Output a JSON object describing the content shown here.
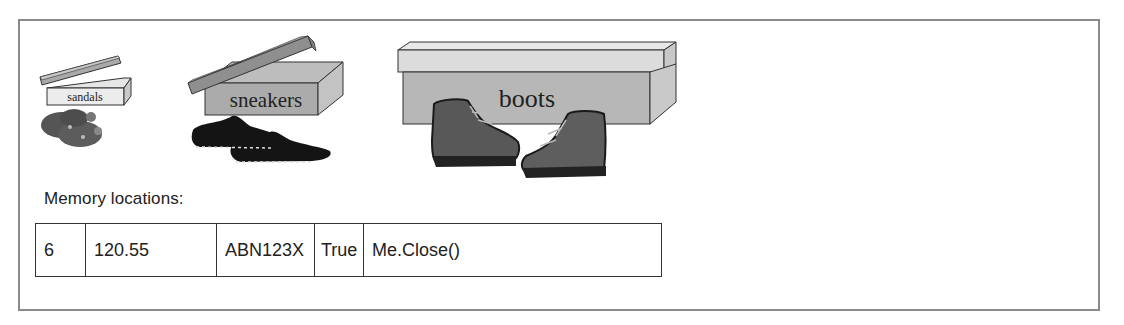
{
  "boxes": [
    {
      "label": "sandals",
      "contents": "sandals",
      "size": "small"
    },
    {
      "label": "sneakers",
      "contents": "sneakers",
      "size": "medium"
    },
    {
      "label": "boots",
      "contents": "boots",
      "size": "large"
    }
  ],
  "memory": {
    "caption": "Memory locations:",
    "cells": [
      "6",
      "120.55",
      "ABN123X",
      "True",
      "Me.Close()"
    ]
  },
  "colors": {
    "frame_border": "#8a8a8a",
    "box_light": "#dcdcdc",
    "box_mid": "#a9a9a9",
    "box_dark": "#8c8c8c",
    "shoe_dark": "#1a1a1a",
    "boot": "#5a5a5a"
  }
}
